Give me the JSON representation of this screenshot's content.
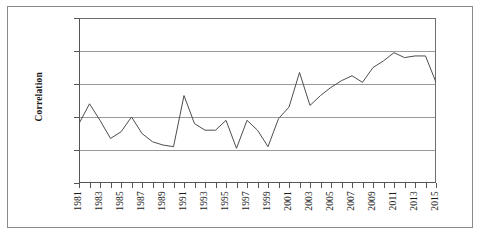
{
  "chart_data": {
    "type": "line",
    "title": "",
    "xlabel": "",
    "ylabel": "Correlation",
    "xlim": [
      1981,
      2015
    ],
    "ylim": [
      0.0,
      1.0
    ],
    "grid": true,
    "legend": "none",
    "y_ticks": [
      "1.0",
      "0.8",
      "0.6",
      "0.4",
      "0.2",
      "0.0"
    ],
    "y_tick_values": [
      1.0,
      0.8,
      0.6,
      0.4,
      0.2,
      0.0
    ],
    "x_tick_labels": [
      "1981",
      "1983",
      "1985",
      "1987",
      "1989",
      "1991",
      "1993",
      "1995",
      "1997",
      "1999",
      "2001",
      "2003",
      "2005",
      "2007",
      "2009",
      "2011",
      "2013",
      "2015"
    ],
    "x": [
      1981,
      1982,
      1983,
      1984,
      1985,
      1986,
      1987,
      1988,
      1989,
      1990,
      1991,
      1992,
      1993,
      1994,
      1995,
      1996,
      1997,
      1998,
      1999,
      2000,
      2001,
      2002,
      2003,
      2004,
      2005,
      2006,
      2007,
      2008,
      2009,
      2010,
      2011,
      2012,
      2013,
      2014,
      2015
    ],
    "values": [
      0.36,
      0.48,
      0.38,
      0.27,
      0.31,
      0.4,
      0.3,
      0.25,
      0.23,
      0.22,
      0.53,
      0.36,
      0.32,
      0.32,
      0.38,
      0.21,
      0.38,
      0.32,
      0.22,
      0.39,
      0.46,
      0.67,
      0.47,
      0.53,
      0.58,
      0.62,
      0.65,
      0.61,
      0.7,
      0.74,
      0.79,
      0.76,
      0.77,
      0.77,
      0.61
    ],
    "series": [
      {
        "name": "Correlation",
        "color": "#4d4d4d",
        "values": [
          0.36,
          0.48,
          0.38,
          0.27,
          0.31,
          0.4,
          0.3,
          0.25,
          0.23,
          0.22,
          0.53,
          0.36,
          0.32,
          0.32,
          0.38,
          0.21,
          0.38,
          0.32,
          0.22,
          0.39,
          0.46,
          0.67,
          0.47,
          0.53,
          0.58,
          0.62,
          0.65,
          0.61,
          0.7,
          0.74,
          0.79,
          0.76,
          0.77,
          0.77,
          0.61
        ]
      }
    ],
    "colors": {
      "line": "#4d4d4d",
      "grid": "#9a9a9a",
      "axis": "#555555",
      "frame": "#8a8a8a",
      "background": "#ffffff"
    }
  }
}
